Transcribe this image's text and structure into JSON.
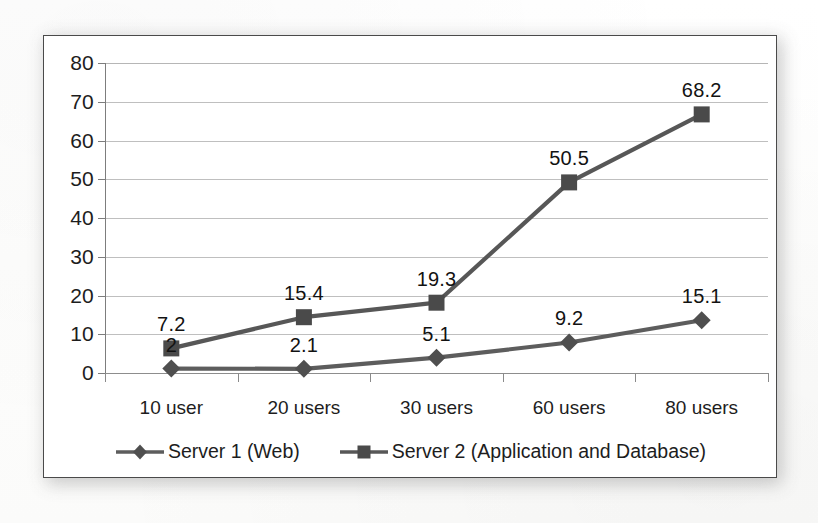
{
  "chart_data": {
    "type": "line",
    "title": "",
    "subtitle": "",
    "xlabel": "",
    "ylabel": "",
    "categories": [
      "10 user",
      "20 users",
      "30 users",
      "60 users",
      "80 users"
    ],
    "yticks": [
      0,
      10,
      20,
      30,
      40,
      50,
      60,
      70,
      80
    ],
    "ylim": [
      0,
      80
    ],
    "grid": true,
    "legend_position": "bottom",
    "series": [
      {
        "name": "Server 1 (Web)",
        "marker": "diamond",
        "color": "#5d5d5d",
        "values": [
          2,
          2.1,
          5.1,
          9.2,
          15.1
        ],
        "labels": [
          "2",
          "2.1",
          "5.1",
          "9.2",
          "15.1"
        ]
      },
      {
        "name": "Server 2 (Application and Database)",
        "marker": "square",
        "color": "#575757",
        "values": [
          7.2,
          15.4,
          19.3,
          50.5,
          68.2
        ],
        "labels": [
          "7.2",
          "15.4",
          "19.3",
          "50.5",
          "68.2"
        ]
      }
    ]
  },
  "legend": {
    "items": [
      {
        "label": "Server 1 (Web)",
        "marker": "diamond-marker-icon"
      },
      {
        "label": "Server 2 (Application and Database)",
        "marker": "square-marker-icon"
      }
    ]
  },
  "colors": {
    "series_1": "#5d5d5d",
    "series_2": "#575757",
    "gridline": "#bfbfbf",
    "axis": "#7d7d7d",
    "text": "#1d1d1d",
    "frame_border": "#4a4a4a",
    "page_background": "#fdfdfd"
  }
}
